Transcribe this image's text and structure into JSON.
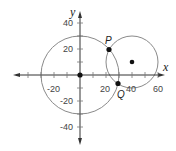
{
  "diagram": {
    "type": "coordinate-plane-circles",
    "axes": {
      "x_label": "x",
      "y_label": "y",
      "x_tick_labels": [
        "-20",
        "20",
        "40",
        "60"
      ],
      "y_tick_labels": [
        "40",
        "20",
        "-20",
        "-40"
      ],
      "tick_spacing": 10,
      "label_spacing": 20
    },
    "circles": [
      {
        "name": "circle-centered-origin",
        "center": [
          0,
          0
        ],
        "radius": 30
      },
      {
        "name": "circle-centered-40-10",
        "center": [
          40,
          10
        ],
        "radius": 20
      }
    ],
    "points": [
      {
        "label": "",
        "name": "origin-center",
        "coords": [
          0,
          0
        ]
      },
      {
        "label": "",
        "name": "small-circle-center",
        "coords": [
          40,
          10
        ]
      },
      {
        "label": "P",
        "name": "intersection-p",
        "coords": [
          22.6,
          19.6
        ]
      },
      {
        "label": "Q",
        "name": "intersection-q",
        "coords": [
          29.2,
          -6.8
        ]
      }
    ],
    "colors": {
      "circle_stroke": "#8a8a8a",
      "axis": "#333333",
      "point": "#111111"
    }
  }
}
